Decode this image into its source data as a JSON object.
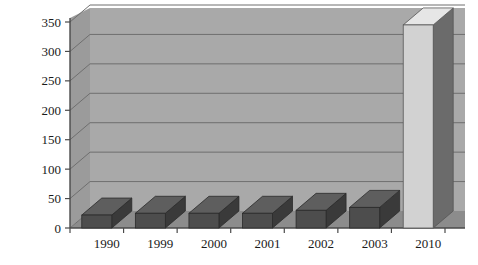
{
  "chart_data": {
    "type": "bar",
    "title": "",
    "subtitle": "",
    "xlabel": "",
    "ylabel": "",
    "categories": [
      "1990",
      "1999",
      "2000",
      "2001",
      "2002",
      "2003",
      "2010"
    ],
    "values": [
      22,
      25,
      25,
      25,
      30,
      35,
      345
    ],
    "series": [
      {
        "name": "",
        "values": [
          22,
          25,
          25,
          25,
          30,
          35,
          345
        ]
      }
    ],
    "ylim": [
      0,
      350
    ],
    "yticks": [
      0,
      50,
      100,
      150,
      200,
      250,
      300,
      350
    ],
    "ytick_labels": [
      "0",
      "50",
      "100",
      "150",
      "200",
      "250",
      "300",
      "350"
    ],
    "grid": true,
    "grid_axis": "y",
    "legend": false,
    "legend_position": "none",
    "style": "3d-column",
    "annotations": [],
    "bar_colors": [
      "#4d4d4d",
      "#4d4d4d",
      "#4d4d4d",
      "#4d4d4d",
      "#4d4d4d",
      "#4d4d4d",
      "#d2d2d2"
    ]
  },
  "colors": {
    "page_background": "#ffffff",
    "wall_back": "#a9a9a9",
    "wall_side": "#9b9b9b",
    "floor": "#8c8c8c",
    "gridline": "#6f6f6f",
    "axis_line": "#4a4a4a",
    "bar_dark_front": "#4d4d4d",
    "bar_dark_top": "#5e5e5e",
    "bar_dark_side": "#3a3a3a",
    "bar_light_front": "#d2d2d2",
    "bar_light_top": "#e6e6e6",
    "bar_light_side": "#6b6b6b",
    "text": "#1a1a1a"
  }
}
